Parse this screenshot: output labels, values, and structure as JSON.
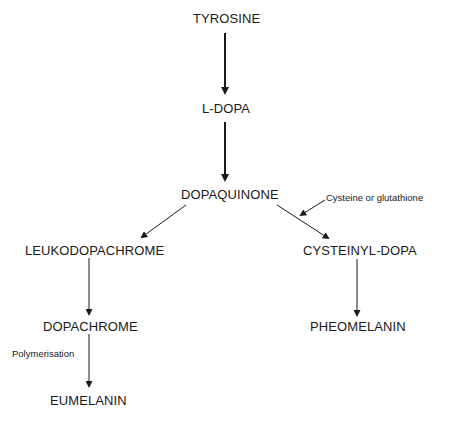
{
  "diagram": {
    "type": "flowchart",
    "nodes": [
      {
        "id": "tyrosine",
        "label": "TYROSINE"
      },
      {
        "id": "ldopa",
        "label": "L-DOPA"
      },
      {
        "id": "dopaquinone",
        "label": "DOPAQUINONE"
      },
      {
        "id": "leukodopachrome",
        "label": "LEUKODOPACHROME"
      },
      {
        "id": "cysteinyldopa",
        "label": "CYSTEINYL-DOPA"
      },
      {
        "id": "dopachrome",
        "label": "DOPACHROME"
      },
      {
        "id": "pheomelanin",
        "label": "PHEOMELANIN"
      },
      {
        "id": "eumelanin",
        "label": "EUMELANIN"
      }
    ],
    "annotations": {
      "cysteine": "Cysteine or glutathione",
      "polymerisation": "Polymerisation"
    },
    "edges": [
      {
        "from": "tyrosine",
        "to": "ldopa",
        "style": "bold"
      },
      {
        "from": "ldopa",
        "to": "dopaquinone",
        "style": "bold"
      },
      {
        "from": "dopaquinone",
        "to": "leukodopachrome"
      },
      {
        "from": "dopaquinone",
        "to": "cysteinyldopa",
        "note": "Cysteine or glutathione"
      },
      {
        "from": "leukodopachrome",
        "to": "dopachrome"
      },
      {
        "from": "dopachrome",
        "to": "eumelanin",
        "note": "Polymerisation"
      },
      {
        "from": "cysteinyldopa",
        "to": "pheomelanin"
      }
    ],
    "colors": {
      "line": "#1a1a1a",
      "text": "#1a1a1a",
      "background": "#ffffff"
    }
  }
}
